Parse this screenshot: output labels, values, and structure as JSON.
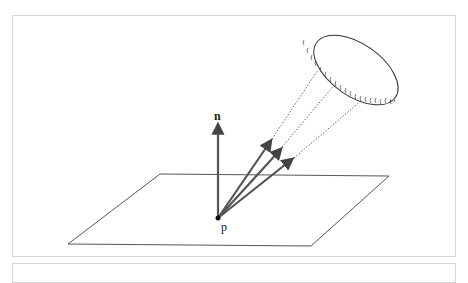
{
  "diagram": {
    "labels": {
      "normal": "n",
      "point": "p"
    },
    "elements": [
      {
        "id": "surface-plane",
        "type": "parallelogram"
      },
      {
        "id": "normal-vector",
        "label": "n"
      },
      {
        "id": "incident-ray-1",
        "style": "solid+dotted"
      },
      {
        "id": "incident-ray-2",
        "style": "solid+dotted"
      },
      {
        "id": "incident-ray-3",
        "style": "solid+dotted"
      },
      {
        "id": "area-light",
        "type": "ellipse",
        "emitter": true
      }
    ],
    "colors": {
      "arrow": "#555555",
      "line": "#333333",
      "frame": "#d6d6d6"
    }
  }
}
